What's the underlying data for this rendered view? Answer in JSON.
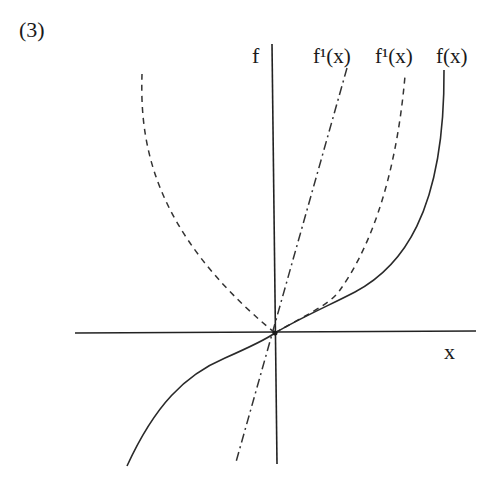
{
  "figure": {
    "panel_label": "(3)",
    "axes": {
      "y_label": "f",
      "x_label": "x"
    },
    "curve_labels": {
      "dashdot": "f¹(x)",
      "dashed": "f¹(x)",
      "solid": "f(x)"
    },
    "colors": {
      "ink": "#222222",
      "background": "#ffffff"
    }
  }
}
